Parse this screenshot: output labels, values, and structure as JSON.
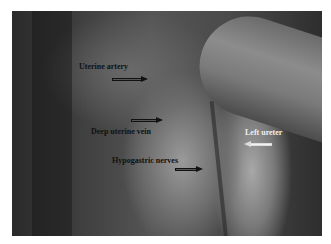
{
  "figure": {
    "labels": [
      {
        "id": "uterine-artery",
        "text": "Uterine artery",
        "arrow_direction": "right",
        "arrow_color": "dark"
      },
      {
        "id": "deep-uterine-vein",
        "text": "Deep uterine vein",
        "arrow_direction": "right",
        "arrow_color": "dark"
      },
      {
        "id": "hypogastric-nerves",
        "text": "Hypogastric nerves",
        "arrow_direction": "right",
        "arrow_color": "dark"
      },
      {
        "id": "left-ureter",
        "text": "Left ureter",
        "arrow_direction": "left",
        "arrow_color": "light"
      }
    ],
    "colors": {
      "background": "#ffffff",
      "dark_label": "#111111",
      "light_label": "#eeeeee"
    }
  }
}
